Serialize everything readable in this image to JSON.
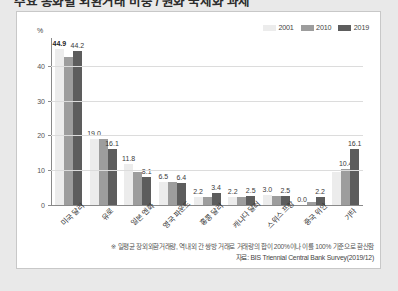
{
  "page": {
    "headline": "주요 통화별 외환거래 비중 / 원화 국제화 과제",
    "background_color": "#e9e9e9",
    "card_background": "#ffffff"
  },
  "legend": {
    "position": "top-right",
    "items": [
      {
        "label": "2001",
        "color": "#ececec"
      },
      {
        "label": "2010",
        "color": "#9d9d9d"
      },
      {
        "label": "2019",
        "color": "#5d5d5d"
      }
    ]
  },
  "axis": {
    "unit_label": "%",
    "y_ticks": [
      "0",
      "10",
      "20",
      "30",
      "40"
    ]
  },
  "footnote": "※ 일평균 장외외환거래량, 역내외 간 쌍방 거래로 거래량의 합이 200%이나 이를 100% 기준으로 환산함",
  "source": "자료: BIS Triennial Central Bank Survey(2019/12)",
  "chart_data": {
    "type": "bar",
    "title": "",
    "xlabel": "",
    "ylabel": "%",
    "ylim": [
      0,
      48
    ],
    "yticks": [
      0,
      10,
      20,
      30,
      40
    ],
    "grid": true,
    "legend_position": "top-right",
    "categories": [
      "미국 달러",
      "유로",
      "일본 엔화",
      "영국 파운드",
      "홍콩 달러",
      "캐나다 달러",
      "스위스 프랑",
      "중국 위안",
      "기타"
    ],
    "series": [
      {
        "name": "2001",
        "color": "#ececec",
        "values": [
          44.9,
          19.0,
          11.8,
          6.5,
          2.2,
          2.2,
          3.0,
          0.0,
          9.6
        ],
        "labels": [
          "44.9",
          "19.0",
          "11.8",
          "6.5",
          "2.2",
          "2.2",
          "3.0",
          "0.0",
          ""
        ]
      },
      {
        "name": "2010",
        "color": "#9d9d9d",
        "values": [
          42.4,
          19.0,
          9.5,
          6.5,
          2.4,
          2.3,
          2.6,
          0.9,
          10.4
        ],
        "labels": [
          "",
          "",
          "",
          "",
          "",
          "",
          "",
          "",
          "10.4"
        ]
      },
      {
        "name": "2019",
        "color": "#5d5d5d",
        "values": [
          44.2,
          16.1,
          8.1,
          6.4,
          3.4,
          2.5,
          2.5,
          2.2,
          16.1
        ],
        "labels": [
          "44.2",
          "16.1",
          "8.1",
          "6.4",
          "3.4",
          "2.5",
          "2.5",
          "2.2",
          "16.1"
        ]
      }
    ]
  }
}
